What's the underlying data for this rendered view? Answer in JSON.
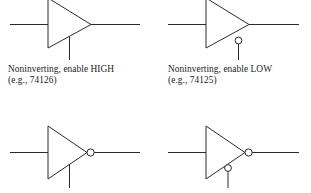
{
  "figure": {
    "background_color": "#ffffff",
    "line_color": "#2b2b2b",
    "text_color": "#1d1d1d"
  },
  "gates": [
    {
      "id": "top-left",
      "function": "Noninverting",
      "enable_polarity": "HIGH",
      "output_bubble": false,
      "enable_bubble": false,
      "part_number": "74126",
      "caption_line1": "Noninverting, enable HIGH",
      "caption_line2": "(e.g., 74126)"
    },
    {
      "id": "top-right",
      "function": "Noninverting",
      "enable_polarity": "LOW",
      "output_bubble": false,
      "enable_bubble": true,
      "part_number": "74125",
      "caption_line1": "Noninverting, enable LOW",
      "caption_line2": "(e.g., 74125)"
    },
    {
      "id": "bottom-left",
      "function": "Inverting",
      "enable_polarity": "HIGH",
      "output_bubble": true,
      "enable_bubble": false,
      "part_number": "",
      "caption_line1": "",
      "caption_line2": ""
    },
    {
      "id": "bottom-right",
      "function": "Inverting",
      "enable_polarity": "LOW",
      "output_bubble": true,
      "enable_bubble": true,
      "part_number": "",
      "caption_line1": "",
      "caption_line2": ""
    }
  ]
}
